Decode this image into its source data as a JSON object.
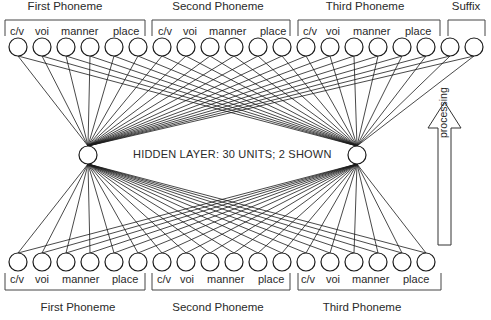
{
  "diagram": {
    "top_groups": [
      {
        "label": "First Phoneme",
        "x": 65
      },
      {
        "label": "Second Phoneme",
        "x": 218
      },
      {
        "label": "Third Phoneme",
        "x": 365
      },
      {
        "label": "Suffix",
        "x": 466
      }
    ],
    "bottom_groups": [
      {
        "label": "First Phoneme",
        "x": 78
      },
      {
        "label": "Second Phoneme",
        "x": 218
      },
      {
        "label": "Third Phoneme",
        "x": 362
      }
    ],
    "feature_labels": [
      "c/v",
      "voi",
      "manner",
      "place"
    ],
    "hidden_layer_label": "HIDDEN LAYER: 30 UNITS; 2 SHOWN",
    "arrow_label": "processing",
    "top_layer_units": 20,
    "bottom_layer_units": 18,
    "hidden_units_shown": 2
  }
}
